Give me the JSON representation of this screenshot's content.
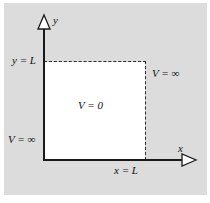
{
  "figure": {
    "panel_color": "#dcdcdc",
    "well_color": "#ffffff",
    "line_color": "#1a1a1a",
    "axes": {
      "y_axis_label": "y",
      "x_axis_label": "x",
      "y_arrow_icon": "hollow-triangle-up",
      "x_arrow_icon": "hollow-triangle-right"
    },
    "labels": {
      "y_boundary": "y = L",
      "x_boundary": "x = L",
      "potential_inside": "V = 0",
      "potential_right": "V = ∞",
      "potential_left": "V = ∞"
    },
    "boundary_style": "dashed"
  }
}
